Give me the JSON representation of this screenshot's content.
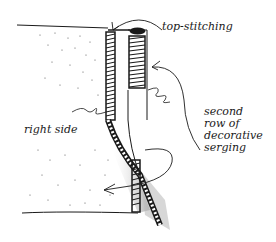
{
  "diagram": {
    "type": "sewing-illustration",
    "labels": {
      "top_stitching": "top-stitching",
      "right_side": "right side",
      "second_row": "second\nrow of\ndecorative\nserging"
    },
    "colors": {
      "ink": "#1a1a1a",
      "background": "#ffffff",
      "shading": "#9a9a9a"
    }
  }
}
